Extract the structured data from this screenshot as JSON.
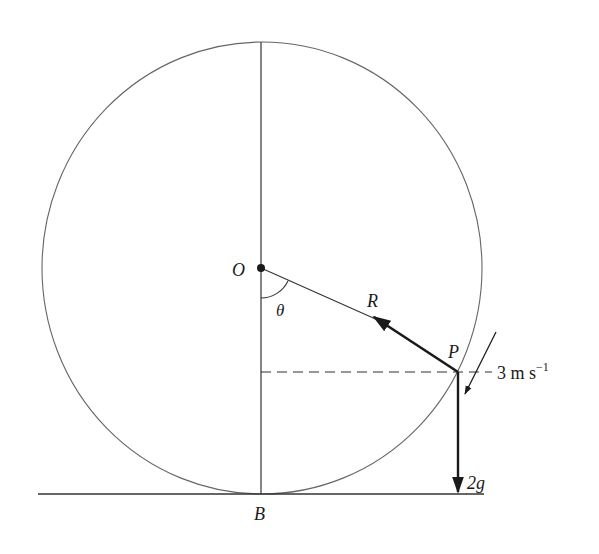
{
  "diagram": {
    "title": "",
    "labels": {
      "center": "O",
      "angle": "θ",
      "reaction": "R",
      "particle": "P",
      "speed_value": "3 m s",
      "speed_exponent": "−1",
      "weight": "2g",
      "bottom_point": "B"
    },
    "elements": [
      {
        "type": "circle",
        "name": "track",
        "center": "O"
      },
      {
        "type": "line",
        "name": "vertical-diameter",
        "from": "top",
        "to": "B"
      },
      {
        "type": "line",
        "name": "radius-OP",
        "from": "O",
        "to": "P"
      },
      {
        "type": "arrow",
        "name": "reaction-force",
        "label": "R",
        "direction": "P toward O"
      },
      {
        "type": "arrow",
        "name": "velocity",
        "label": "3 m s⁻¹",
        "direction": "tangent, downward-left"
      },
      {
        "type": "arrow",
        "name": "weight-force",
        "label": "2g",
        "direction": "down"
      },
      {
        "type": "dashed-line",
        "name": "horizontal-through-P"
      },
      {
        "type": "line",
        "name": "ground",
        "tangent_at": "B"
      },
      {
        "type": "angle-arc",
        "name": "theta",
        "between": "OB and OP"
      }
    ],
    "colors": {
      "stroke": "#1a1a1a",
      "circle": "#555555",
      "background": "#ffffff"
    }
  }
}
